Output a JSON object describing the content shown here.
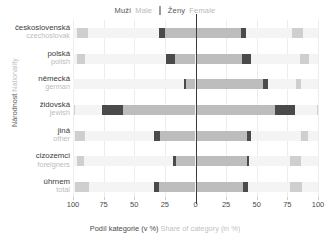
{
  "legend": {
    "male_cz": "Muži",
    "male_en": "Male",
    "female_cz": "Ženy",
    "female_en": "Female"
  },
  "axes": {
    "y_title_cz": "Národnost",
    "y_title_en": "Nationality",
    "x_title_cz": "Podíl kategorie (v %)",
    "x_title_en": "Share of category (in %)"
  },
  "colors": {
    "band": "#f4f4f4",
    "bar_main": "#bdbdbd",
    "bar_cap": "#4a4a4a",
    "bar_outer": "#cfcfcf",
    "zero_line": "#3d3d3d",
    "grid": "#ededed"
  },
  "chart_data": {
    "type": "bar",
    "orientation": "horizontal-diverging",
    "title": "",
    "xlabel": "Podíl kategorie (v %) / Share of category (in %)",
    "ylabel": "Národnost / Nationality",
    "xlim": [
      -100,
      100
    ],
    "xticks": [
      100,
      75,
      50,
      25,
      0,
      25,
      50,
      75,
      100
    ],
    "xtick_values": [
      -100,
      -75,
      -50,
      -25,
      0,
      25,
      50,
      75,
      100
    ],
    "grid": true,
    "legend_position": "top-center",
    "series": [
      {
        "name": "Muži / Male",
        "side": "left"
      },
      {
        "name": "Ženy / Female",
        "side": "right"
      }
    ],
    "categories": [
      {
        "cz": "československá",
        "en": "czechoslovak"
      },
      {
        "cz": "polská",
        "en": "polish"
      },
      {
        "cz": "německá",
        "en": "german"
      },
      {
        "cz": "židovská",
        "en": "jewish"
      },
      {
        "cz": "jiná",
        "en": "other"
      },
      {
        "cz": "cizozemci",
        "en": "foreigners"
      },
      {
        "cz": "úhrnem",
        "en": "total"
      }
    ],
    "rows": [
      {
        "category_cz": "československá",
        "category_en": "czechoslovak",
        "male_start": -30,
        "male_end": 0,
        "female_start": 0,
        "female_end": 41,
        "male_cap": [
          -30,
          -25
        ],
        "female_cap": [
          37,
          41
        ],
        "outer_left": [
          -97,
          -88
        ],
        "outer_right": [
          79,
          88
        ]
      },
      {
        "category_cz": "polská",
        "category_en": "polish",
        "male_start": -24,
        "male_end": 0,
        "female_start": 0,
        "female_end": 45,
        "male_cap": [
          -24,
          -17
        ],
        "female_cap": [
          38,
          45
        ],
        "outer_left": [
          -97,
          -90
        ],
        "outer_right": [
          85,
          93
        ]
      },
      {
        "category_cz": "německá",
        "category_en": "german",
        "male_start": -9,
        "male_end": 0,
        "female_start": 0,
        "female_end": 59,
        "male_cap": [
          -9,
          -8
        ],
        "female_cap": [
          55,
          59
        ],
        "outer_left": null,
        "outer_right": [
          82,
          86
        ]
      },
      {
        "category_cz": "židovská",
        "category_en": "jewish",
        "male_start": -76,
        "male_end": 0,
        "female_start": 0,
        "female_end": 81,
        "male_cap": [
          -76,
          -59
        ],
        "female_cap": [
          65,
          81
        ],
        "outer_left": [
          -99,
          -98
        ],
        "outer_right": [
          99,
          100
        ]
      },
      {
        "category_cz": "jiná",
        "category_en": "other",
        "male_start": -34,
        "male_end": 0,
        "female_start": 0,
        "female_end": 45,
        "male_cap": [
          -34,
          -29
        ],
        "female_cap": [
          42,
          45
        ],
        "outer_left": [
          -98,
          -90
        ],
        "outer_right": [
          86,
          92
        ]
      },
      {
        "category_cz": "cizozemci",
        "category_en": "foreigners",
        "male_start": -18,
        "male_end": 0,
        "female_start": 0,
        "female_end": 44,
        "male_cap": [
          -18,
          -16
        ],
        "female_cap": [
          42,
          44
        ],
        "outer_left": [
          -97,
          -91
        ],
        "outer_right": [
          77,
          86
        ]
      },
      {
        "category_cz": "úhrnem",
        "category_en": "total",
        "male_start": -34,
        "male_end": 0,
        "female_start": 0,
        "female_end": 43,
        "male_cap": [
          -34,
          -30
        ],
        "female_cap": [
          39,
          43
        ],
        "outer_left": [
          -98,
          -87
        ],
        "outer_right": [
          77,
          87
        ]
      }
    ]
  }
}
